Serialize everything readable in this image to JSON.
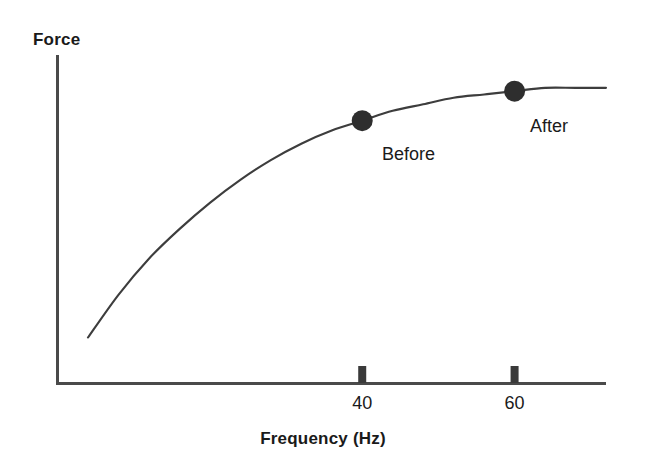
{
  "chart_data": {
    "type": "line",
    "title": "",
    "subtitle": "",
    "xlabel": "Frequency (Hz)",
    "ylabel": "Force",
    "xlim": [
      0,
      72
    ],
    "ylim": [
      0,
      100
    ],
    "grid": false,
    "legend_position": "none",
    "xticks": [
      {
        "value": 40,
        "label": "40"
      },
      {
        "value": 60,
        "label": "60"
      }
    ],
    "yticks": [],
    "series": [
      {
        "name": "force-frequency-curve",
        "type": "line",
        "color": "#3d3d3d",
        "points": [
          {
            "x": 4,
            "y": 14
          },
          {
            "x": 8,
            "y": 27
          },
          {
            "x": 12,
            "y": 38
          },
          {
            "x": 16,
            "y": 47
          },
          {
            "x": 20,
            "y": 55
          },
          {
            "x": 24,
            "y": 62
          },
          {
            "x": 28,
            "y": 68
          },
          {
            "x": 32,
            "y": 73
          },
          {
            "x": 36,
            "y": 77
          },
          {
            "x": 40,
            "y": 80
          },
          {
            "x": 44,
            "y": 83
          },
          {
            "x": 48,
            "y": 85
          },
          {
            "x": 52,
            "y": 87
          },
          {
            "x": 56,
            "y": 88
          },
          {
            "x": 60,
            "y": 89
          },
          {
            "x": 64,
            "y": 90
          },
          {
            "x": 68,
            "y": 90
          },
          {
            "x": 72,
            "y": 90
          }
        ]
      }
    ],
    "annotations": [
      {
        "id": "before",
        "label": "Before",
        "x": 40,
        "y": 80,
        "marker": "filled-circle",
        "color": "#2e2e2e"
      },
      {
        "id": "after",
        "label": "After",
        "x": 60,
        "y": 89,
        "marker": "filled-circle",
        "color": "#2e2e2e"
      }
    ],
    "colors": {
      "axis": "#4a4a4a",
      "curve": "#3d3d3d",
      "marker": "#2e2e2e",
      "text": "#1a1a1a",
      "background": "#ffffff"
    }
  },
  "axes": {
    "y_title": "Force",
    "x_title": "Frequency (Hz)"
  },
  "ticks": {
    "x": [
      {
        "label": "40"
      },
      {
        "label": "60"
      }
    ]
  },
  "markers": {
    "before_label": "Before",
    "after_label": "After"
  }
}
